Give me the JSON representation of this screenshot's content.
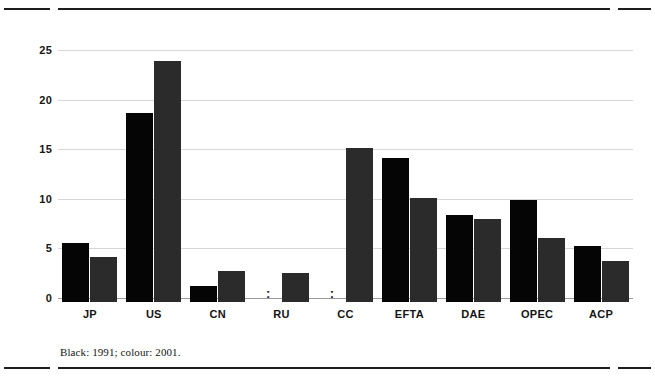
{
  "footnote": "Black: 1991; colour: 2001.",
  "missing_symbol": ":",
  "colors": {
    "series_1991": "#050505",
    "series_2001": "#2b2b2b",
    "gridline": "#d7d7d7",
    "rule": "#1d1d1d",
    "text": "#141414"
  },
  "chart_data": {
    "type": "bar",
    "title": "",
    "subtitle": "",
    "xlabel": "",
    "ylabel": "",
    "ylim": [
      0,
      26
    ],
    "yticks": [
      0,
      5,
      10,
      15,
      20,
      25
    ],
    "ytick_labels": [
      "0",
      "5",
      "10",
      "15",
      "20",
      "25"
    ],
    "grid": true,
    "legend_position": "footnote",
    "categories": [
      "JP",
      "US",
      "CN",
      "RU",
      "CC",
      "EFTA",
      "DAE",
      "OPEC",
      "ACP"
    ],
    "series": [
      {
        "name": "1991",
        "color": "#050505",
        "values": [
          5.9,
          19.0,
          1.6,
          null,
          null,
          14.5,
          8.8,
          10.3,
          5.6
        ]
      },
      {
        "name": "2001",
        "color": "#2b2b2b",
        "values": [
          4.5,
          24.3,
          3.1,
          2.9,
          15.5,
          10.5,
          8.4,
          6.5,
          4.1
        ]
      }
    ],
    "annotations": [
      {
        "category": "RU",
        "series": "1991",
        "text": ":",
        "meaning": "not available"
      },
      {
        "category": "CC",
        "series": "1991",
        "text": ":",
        "meaning": "not available"
      }
    ]
  }
}
